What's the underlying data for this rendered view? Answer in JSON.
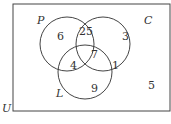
{
  "diagram": {
    "type": "venn",
    "universe_label": "U",
    "sets": [
      {
        "name": "P",
        "label": "P"
      },
      {
        "name": "C",
        "label": "C"
      },
      {
        "name": "L",
        "label": "L"
      }
    ],
    "regions": {
      "P_only": "6",
      "P_and_C_only": "25",
      "C_only": "3",
      "P_and_C_and_L": "7",
      "P_and_L_only": "4",
      "C_and_L_only": "1",
      "L_only": "9",
      "outside": "5"
    },
    "colors": {
      "stroke": "#444444",
      "text": "#333333"
    }
  }
}
